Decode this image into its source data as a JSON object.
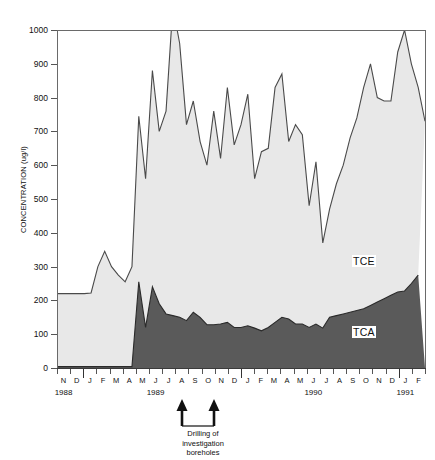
{
  "chart_data": {
    "type": "area",
    "stacked": true,
    "title": "",
    "xlabel": "",
    "ylabel": "CONCENTRATION (ug/l)",
    "ylim": [
      0,
      1000
    ],
    "ytick_values": [
      0,
      100,
      200,
      300,
      400,
      500,
      600,
      700,
      800,
      900,
      1000
    ],
    "ytick_labels": [
      "0",
      "100",
      "200",
      "300",
      "400",
      "500",
      "600",
      "700",
      "800",
      "900",
      "1000"
    ],
    "grid": false,
    "legend_position": "inline-on-bands",
    "x_month_labels": [
      "N",
      "D",
      "J",
      "F",
      "M",
      "A",
      "M",
      "J",
      "J",
      "A",
      "S",
      "O",
      "N",
      "D",
      "J",
      "F",
      "M",
      "A",
      "M",
      "J",
      "J",
      "A",
      "S",
      "O",
      "N",
      "D",
      "J",
      "F"
    ],
    "x_year_labels": [
      {
        "label": "1988",
        "at_index": 0.5
      },
      {
        "label": "1989",
        "at_index": 7.5
      },
      {
        "label": "1990",
        "at_index": 19.5
      },
      {
        "label": "1991",
        "at_index": 26.5
      }
    ],
    "x_year_boundaries_index": [
      2,
      14,
      26
    ],
    "series": [
      {
        "name": "TCE",
        "color": "#e8e8e8",
        "line_color": "#4a4a4a",
        "note": "upper band; values are total (TCE+TCA) stack top",
        "values_total": [
          220,
          220,
          220,
          220,
          220,
          222,
          300,
          345,
          300,
          275,
          255,
          300,
          745,
          560,
          880,
          700,
          760,
          1070,
          960,
          720,
          790,
          670,
          600,
          760,
          620,
          830,
          660,
          720,
          810,
          560,
          640,
          650,
          830,
          870,
          670,
          720,
          690,
          480,
          610,
          370,
          470,
          545,
          600,
          680,
          740,
          830,
          900,
          800,
          790,
          790,
          935,
          1000,
          900,
          830,
          730
        ]
      },
      {
        "name": "TCA",
        "color": "#5a5a5a",
        "line_color": "#2a2a2a",
        "note": "lower band; baseline series",
        "values": [
          4,
          4,
          4,
          4,
          4,
          4,
          4,
          4,
          4,
          4,
          4,
          4,
          255,
          120,
          240,
          190,
          160,
          155,
          150,
          140,
          165,
          150,
          128,
          128,
          130,
          135,
          120,
          120,
          125,
          118,
          110,
          120,
          135,
          150,
          145,
          130,
          130,
          120,
          130,
          118,
          150,
          155,
          160,
          165,
          170,
          175,
          185,
          195,
          205,
          215,
          225,
          228,
          250,
          275
        ]
      }
    ],
    "annotation": {
      "text_lines": [
        "Drilling of",
        "investigation",
        "boreholes"
      ],
      "arrow_count": 2,
      "arrow_months": [
        "A 1989",
        "S 1989"
      ]
    }
  },
  "labels": {
    "tce": "TCE",
    "tca": "TCA",
    "axis_title": "CONCENTRATION (ug/l)"
  }
}
